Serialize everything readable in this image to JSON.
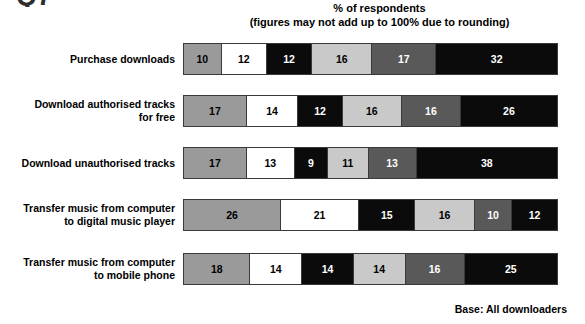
{
  "partial_glyph": "Q7",
  "header": {
    "line1": "% of respondents",
    "line2": "(figures may not add up to 100% due to rounding)"
  },
  "footer": {
    "base_note": "Base: All downloaders"
  },
  "palette": {
    "medium_gray": "#9a9a9a",
    "white": "#ffffff",
    "black": "#0b0b0b",
    "light_gray": "#c9c9c9",
    "dark_gray": "#595959",
    "black2": "#0b0b0b",
    "border": "#3a3a3a"
  },
  "chart_data": {
    "type": "bar",
    "orientation": "horizontal",
    "stacked": true,
    "title": "% of respondents",
    "subtitle": "(figures may not add up to 100% due to rounding)",
    "xlabel": "",
    "ylabel": "",
    "xlim": [
      0,
      100
    ],
    "grid": false,
    "legend": "none",
    "annotation": "Base: All downloaders",
    "value_unit": "%",
    "categories": [
      "Purchase downloads",
      "Download authorised tracks\nfor free",
      "Download unauthorised tracks",
      "Transfer music from computer\nto digital music player",
      "Transfer music from computer\nto mobile phone"
    ],
    "series": [
      {
        "name": "Segment 1",
        "color": "#9a9a9a",
        "values": [
          10,
          17,
          17,
          26,
          18
        ]
      },
      {
        "name": "Segment 2",
        "color": "#ffffff",
        "values": [
          12,
          14,
          13,
          21,
          14
        ]
      },
      {
        "name": "Segment 3",
        "color": "#0b0b0b",
        "values": [
          12,
          12,
          9,
          15,
          14
        ]
      },
      {
        "name": "Segment 4",
        "color": "#c9c9c9",
        "values": [
          16,
          16,
          11,
          16,
          14
        ]
      },
      {
        "name": "Segment 5",
        "color": "#595959",
        "values": [
          17,
          16,
          13,
          10,
          16
        ]
      },
      {
        "name": "Segment 6",
        "color": "#0b0b0b",
        "values": [
          32,
          26,
          38,
          12,
          25
        ]
      }
    ],
    "row_totals": [
      99,
      101,
      101,
      100,
      101
    ]
  },
  "rows": [
    {
      "label": "Purchase downloads",
      "segments": [
        {
          "value": "10",
          "pct": 10
        },
        {
          "value": "12",
          "pct": 12
        },
        {
          "value": "12",
          "pct": 12
        },
        {
          "value": "16",
          "pct": 16
        },
        {
          "value": "17",
          "pct": 17
        },
        {
          "value": "32",
          "pct": 32
        }
      ]
    },
    {
      "label": "Download authorised tracks\nfor free",
      "segments": [
        {
          "value": "17",
          "pct": 17
        },
        {
          "value": "14",
          "pct": 14
        },
        {
          "value": "12",
          "pct": 12
        },
        {
          "value": "16",
          "pct": 16
        },
        {
          "value": "16",
          "pct": 16
        },
        {
          "value": "26",
          "pct": 26
        }
      ]
    },
    {
      "label": "Download unauthorised tracks",
      "segments": [
        {
          "value": "17",
          "pct": 17
        },
        {
          "value": "13",
          "pct": 13
        },
        {
          "value": "9",
          "pct": 9
        },
        {
          "value": "11",
          "pct": 11
        },
        {
          "value": "13",
          "pct": 13
        },
        {
          "value": "38",
          "pct": 38
        }
      ]
    },
    {
      "label": "Transfer music from computer\nto digital music player",
      "segments": [
        {
          "value": "26",
          "pct": 26
        },
        {
          "value": "21",
          "pct": 21
        },
        {
          "value": "15",
          "pct": 15
        },
        {
          "value": "16",
          "pct": 16
        },
        {
          "value": "10",
          "pct": 10
        },
        {
          "value": "12",
          "pct": 12
        }
      ]
    },
    {
      "label": "Transfer music from computer\nto mobile phone",
      "segments": [
        {
          "value": "18",
          "pct": 18
        },
        {
          "value": "14",
          "pct": 14
        },
        {
          "value": "14",
          "pct": 14
        },
        {
          "value": "14",
          "pct": 14
        },
        {
          "value": "16",
          "pct": 16
        },
        {
          "value": "25",
          "pct": 25
        }
      ]
    }
  ]
}
